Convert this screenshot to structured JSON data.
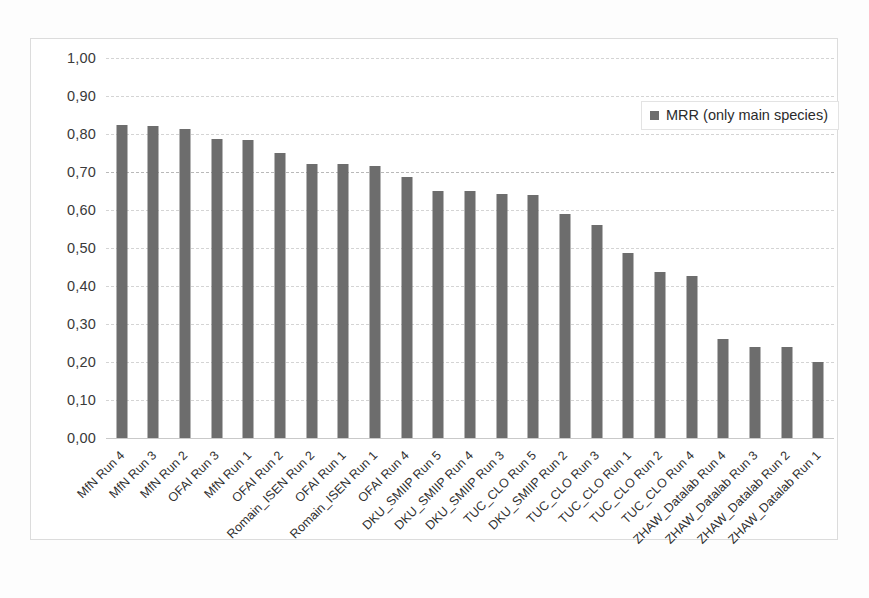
{
  "chart_data": {
    "type": "bar",
    "title": "",
    "xlabel": "",
    "ylabel": "",
    "ylim": [
      0.0,
      1.0
    ],
    "ytick_labels": [
      "0,00",
      "0,10",
      "0,20",
      "0,30",
      "0,40",
      "0,50",
      "0,60",
      "0,70",
      "0,80",
      "0,90",
      "1,00"
    ],
    "ytick_values": [
      0.0,
      0.1,
      0.2,
      0.3,
      0.4,
      0.5,
      0.6,
      0.7,
      0.8,
      0.9,
      1.0
    ],
    "grid": true,
    "grid_style": "dashed-horizontal",
    "legend_position": "top-right",
    "legend": [
      "MRR (only main species)"
    ],
    "series_color": "#6d6d6d",
    "categories": [
      "MfN Run 4",
      "MfN Run 3",
      "MfN Run 2",
      "OFAI Run 3",
      "MfN Run 1",
      "OFAI Run 2",
      "Romain_ISEN Run 2",
      "OFAI Run 1",
      "Romain_ISEN Run 1",
      "OFAI Run 4",
      "DKU_SMIIP Run 5",
      "DKU_SMIIP Run 4",
      "DKU_SMIIP Run 3",
      "TUC_CLO Run 5",
      "DKU_SMIIP Run 2",
      "TUC_CLO Run 3",
      "TUC_CLO Run 1",
      "TUC_CLO Run 2",
      "TUC_CLO Run 4",
      "ZHAW_Datalab Run 4",
      "ZHAW_Datalab Run 3",
      "ZHAW_Datalab Run 2",
      "ZHAW_Datalab Run 1"
    ],
    "series": [
      {
        "name": "MRR (only main species)",
        "values": [
          0.825,
          0.822,
          0.812,
          0.787,
          0.783,
          0.75,
          0.722,
          0.721,
          0.716,
          0.686,
          0.65,
          0.65,
          0.641,
          0.639,
          0.589,
          0.56,
          0.487,
          0.436,
          0.427,
          0.26,
          0.239,
          0.239,
          0.2
        ]
      }
    ]
  },
  "legend": {
    "entry_label": "MRR (only main species)",
    "swatch_name": "series-color-swatch"
  }
}
